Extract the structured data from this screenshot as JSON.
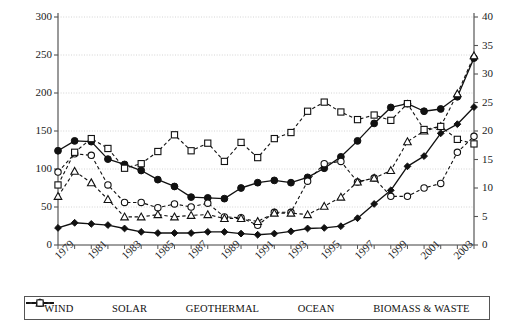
{
  "chart_data": {
    "type": "line",
    "title": "",
    "xlabel": "",
    "ylabel": "",
    "y2label": "",
    "grid": true,
    "legend_position": "bottom",
    "x": [
      1979,
      1980,
      1981,
      1982,
      1983,
      1984,
      1985,
      1986,
      1987,
      1988,
      1989,
      1990,
      1991,
      1992,
      1993,
      1994,
      1995,
      1996,
      1997,
      1998,
      1999,
      2000,
      2001,
      2002,
      2003,
      2004
    ],
    "xtick_labels": [
      "1979",
      "1981",
      "1983",
      "1985",
      "1987",
      "1989",
      "1991",
      "1993",
      "1995",
      "1997",
      "1999",
      "2001",
      "2003"
    ],
    "ylim": [
      0,
      300
    ],
    "yticks": [
      "0",
      "50",
      "100",
      "150",
      "200",
      "250",
      "300"
    ],
    "y2lim": [
      0,
      40
    ],
    "y2ticks": [
      "0",
      "5",
      "10",
      "15",
      "20",
      "25",
      "30",
      "35",
      "40"
    ],
    "series": [
      {
        "name": "WIND",
        "axis": "right",
        "marker": "filled-diamond",
        "line": "solid",
        "color": "#111111",
        "values": [
          3.0,
          3.9,
          3.7,
          3.5,
          2.9,
          2.3,
          2.1,
          2.1,
          2.1,
          2.3,
          2.3,
          2.0,
          1.8,
          2.0,
          2.4,
          2.9,
          3.0,
          3.3,
          4.7,
          7.2,
          9.6,
          13.8,
          15.6,
          19.6,
          21.2,
          24.2
        ]
      },
      {
        "name": "SOLAR",
        "axis": "left",
        "marker": "filled-circle",
        "line": "solid",
        "color": "#111111",
        "values": [
          124,
          137,
          136,
          113,
          106,
          98,
          86,
          77,
          63,
          62,
          61,
          75,
          82,
          85,
          82,
          89,
          101,
          116,
          137,
          160,
          181,
          186,
          176,
          179,
          195,
          246
        ]
      },
      {
        "name": "GEOTHERMAL",
        "axis": "left",
        "marker": "open-circle",
        "line": "dashed",
        "color": "#111111",
        "values": [
          96,
          120,
          118,
          79,
          56,
          56,
          49,
          54,
          50,
          55,
          37,
          36,
          26,
          43,
          43,
          84,
          107,
          110,
          83,
          88,
          64,
          64,
          75,
          81,
          122,
          143
        ]
      },
      {
        "name": "OCEAN",
        "axis": "left",
        "marker": "open-triangle",
        "line": "dashed",
        "color": "#111111",
        "values": [
          64,
          97,
          82,
          60,
          37,
          37,
          40,
          37,
          39,
          40,
          35,
          35,
          31,
          42,
          42,
          40,
          51,
          63,
          83,
          88,
          98,
          136,
          150,
          156,
          199,
          249
        ]
      },
      {
        "name": "BIOMASS & WASTE",
        "axis": "left",
        "marker": "open-square",
        "line": "dashed",
        "color": "#111111",
        "values": [
          79,
          122,
          140,
          127,
          101,
          107,
          123,
          145,
          124,
          134,
          110,
          135,
          115,
          140,
          148,
          176,
          188,
          175,
          165,
          171,
          164,
          186,
          152,
          156,
          139,
          133
        ]
      }
    ]
  },
  "legend": {
    "items": [
      {
        "label": "WIND",
        "marker": "filled-diamond",
        "line": "solid"
      },
      {
        "label": "SOLAR",
        "marker": "filled-circle",
        "line": "solid"
      },
      {
        "label": "GEOTHERMAL",
        "marker": "open-circle",
        "line": "dashed"
      },
      {
        "label": "OCEAN",
        "marker": "open-triangle",
        "line": "dashed"
      },
      {
        "label": "BIOMASS & WASTE",
        "marker": "open-square",
        "line": "dashed"
      }
    ]
  },
  "colors": {
    "ink": "#111111",
    "grid": "#c9c9c9",
    "axis": "#555555",
    "background": "#ffffff"
  }
}
